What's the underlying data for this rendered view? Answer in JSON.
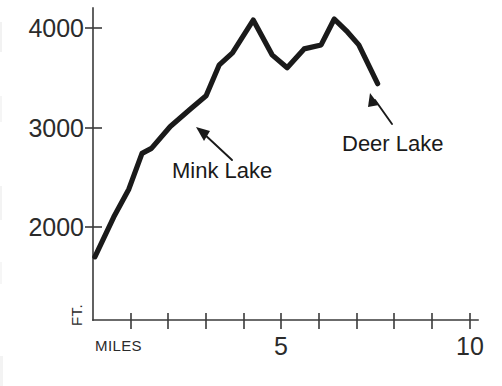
{
  "chart_data": {
    "type": "line",
    "title": "",
    "subtitle": "",
    "xlabel": "MILES",
    "ylabel": "FT.",
    "xlim": [
      0,
      10
    ],
    "ylim": [
      1200,
      4300
    ],
    "grid": false,
    "legend": null,
    "x_ticks": [
      1,
      2,
      3,
      4,
      5,
      6,
      7,
      8,
      9,
      10
    ],
    "x_tick_labels": [
      "",
      "",
      "",
      "",
      "5",
      "",
      "",
      "",
      "",
      "10"
    ],
    "y_ticks": [
      2000,
      3000,
      4000
    ],
    "y_tick_labels": [
      "2000",
      "3000",
      "4000"
    ],
    "series": [
      {
        "name": "Elevation profile",
        "color": "#1a1a1a",
        "x": [
          0.05,
          0.55,
          0.95,
          1.3,
          1.55,
          2.05,
          2.6,
          3.0,
          3.35,
          3.7,
          4.25,
          4.75,
          5.15,
          5.6,
          6.05,
          6.4,
          6.75,
          7.05,
          7.55
        ],
        "y": [
          1700,
          2100,
          2380,
          2740,
          2790,
          3010,
          3190,
          3320,
          3630,
          3750,
          4080,
          3730,
          3600,
          3790,
          3830,
          4090,
          3960,
          3830,
          3440
        ]
      }
    ],
    "annotations": [
      {
        "label": "Mink Lake",
        "points_to_x": 2.45,
        "points_to_y": 3150,
        "text_x": 2.18,
        "text_y": 2480
      },
      {
        "label": "Deer Lake",
        "points_to_x": 7.35,
        "points_to_y": 3530,
        "text_x": 7.55,
        "text_y": 2880
      }
    ]
  },
  "axes": {
    "y_label": "FT.",
    "x_label": "MILES",
    "y_tick_4000": "4000",
    "y_tick_3000": "3000",
    "y_tick_2000": "2000",
    "x_tick_5": "5",
    "x_tick_10": "10"
  },
  "annotations": {
    "mink_lake": "Mink Lake",
    "deer_lake": "Deer Lake"
  },
  "colors": {
    "line": "#1a1a1a",
    "axis": "#3a3a3a",
    "text": "#2b2b2b",
    "background": "#ffffff"
  }
}
